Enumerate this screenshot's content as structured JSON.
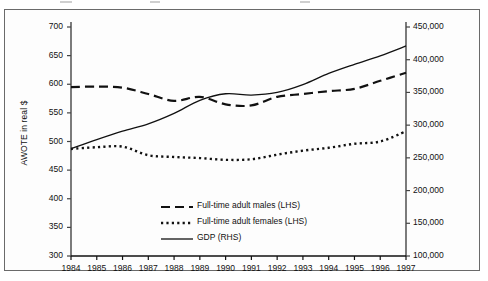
{
  "chart_data": {
    "type": "line",
    "title": "",
    "subtitle": "",
    "xlabel": "",
    "ylabel": "AWOTE in real $",
    "y2label": "GDP in $m at 1989-90 prices",
    "grid": false,
    "legend_position": "inside-bottom-center",
    "x": [
      1984,
      1985,
      1986,
      1987,
      1988,
      1989,
      1990,
      1991,
      1992,
      1993,
      1994,
      1995,
      1996,
      1997
    ],
    "xtick_labels": [
      "1984",
      "1985",
      "1986",
      "1987",
      "1988",
      "1989",
      "1990",
      "1991",
      "1992",
      "1993",
      "1994",
      "1995",
      "1996",
      "1997"
    ],
    "ylim": [
      300,
      700
    ],
    "ytick_labels": [
      "300",
      "350",
      "400",
      "450",
      "500",
      "550",
      "600",
      "650",
      "700"
    ],
    "ytick_values": [
      300,
      350,
      400,
      450,
      500,
      550,
      600,
      650,
      700
    ],
    "y2lim": [
      100000,
      450000
    ],
    "y2tick_labels": [
      "100,000",
      "150,000",
      "200,000",
      "250,000",
      "300,000",
      "350,000",
      "400,000",
      "450,000"
    ],
    "y2tick_values": [
      100000,
      150000,
      200000,
      250000,
      300000,
      350000,
      400000,
      450000
    ],
    "series": [
      {
        "name": "Full-time adult males (LHS)",
        "axis": "left",
        "style": "dashed",
        "values": [
          595,
          596,
          594,
          583,
          571,
          578,
          565,
          563,
          578,
          583,
          588,
          592,
          606,
          620
        ]
      },
      {
        "name": "Full-time adult females (LHS)",
        "axis": "left",
        "style": "dotted",
        "values": [
          487,
          490,
          491,
          476,
          473,
          471,
          468,
          469,
          477,
          484,
          489,
          496,
          500,
          518
        ]
      },
      {
        "name": "GDP (RHS)",
        "axis": "right",
        "style": "solid",
        "values": [
          264000,
          278000,
          291000,
          302000,
          318000,
          338000,
          348000,
          346000,
          350000,
          362000,
          379000,
          393000,
          406000,
          421000
        ]
      }
    ]
  },
  "legend": {
    "items": [
      {
        "label": "Full-time adult males (LHS)",
        "style": "dashed"
      },
      {
        "label": "Full-time adult females (LHS)",
        "style": "dotted"
      },
      {
        "label": "GDP (RHS)",
        "style": "solid"
      }
    ]
  },
  "colors": {
    "line": "#111111",
    "axis": "#444444",
    "frame": "#6a6a6a",
    "background": "#fdfdfd"
  }
}
